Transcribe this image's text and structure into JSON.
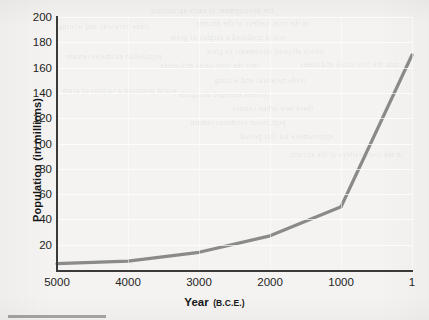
{
  "chart_data": {
    "type": "line",
    "title": "",
    "xlabel": "Year",
    "xlabel_sub": "(B.C.E.)",
    "ylabel": "Population (in millions)",
    "x_ticks": [
      "5000",
      "4000",
      "3000",
      "2000",
      "1000",
      "1"
    ],
    "y_ticks": [
      "200",
      "180",
      "160",
      "140",
      "120",
      "100",
      "80",
      "60",
      "40",
      "20"
    ],
    "xlim": [
      5000,
      1
    ],
    "ylim": [
      0,
      200
    ],
    "x_reversed": true,
    "grid": "horizontal",
    "legend": "none",
    "series": [
      {
        "name": "World population",
        "color": "#8a8a8a",
        "x": [
          5000,
          4000,
          3000,
          2000,
          1000,
          1
        ],
        "values": [
          5,
          7,
          14,
          27,
          50,
          170
        ]
      }
    ]
  },
  "axes": {
    "line_color": "#3a3a3a",
    "tick_text_color": "#232323",
    "gridline_color": "#ffffff"
  },
  "paper": {
    "background": "#f4f3f1",
    "bleed_lines": [
      "the development of early agriculture",
      "in the river valleys of the ancient",
      "world produced a surplus of grain",
      "which allowed settlements to grow",
      "into the first cities and states",
      "trade networks and writing",
      "systems emerged alongside",
      "these new urban centers",
      "population estimates remain",
      "approximate for this period"
    ]
  }
}
